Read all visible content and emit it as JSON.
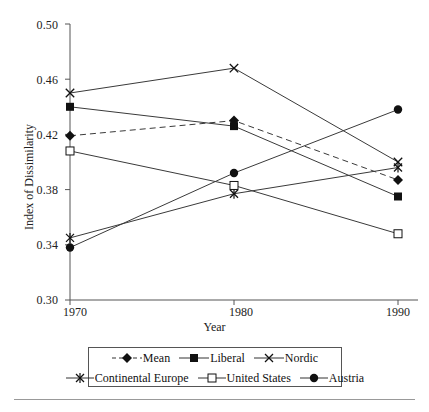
{
  "chart_data": {
    "type": "line",
    "title": "",
    "xlabel": "Year",
    "ylabel": "Index of Dissimilarity",
    "x": [
      1970,
      1980,
      1990
    ],
    "xtick_labels": [
      "1970",
      "1980",
      "1990"
    ],
    "ytick_labels": [
      "0.30",
      "0.34",
      "0.38",
      "0.42",
      "0.46",
      "0.50"
    ],
    "yticks": [
      0.3,
      0.34,
      0.38,
      0.42,
      0.46,
      0.5
    ],
    "ylim": [
      0.3,
      0.5
    ],
    "xlim": [
      1970,
      1990
    ],
    "grid": false,
    "legend_position": "below-bottom-center",
    "series": [
      {
        "name": "Mean",
        "marker": "filled-diamond",
        "linestyle": "dashed",
        "values": [
          0.419,
          0.43,
          0.387
        ]
      },
      {
        "name": "Liberal",
        "marker": "filled-square",
        "linestyle": "solid",
        "values": [
          0.44,
          0.426,
          0.375
        ]
      },
      {
        "name": "Nordic",
        "marker": "cross-x",
        "linestyle": "solid",
        "values": [
          0.45,
          0.468,
          0.4
        ]
      },
      {
        "name": "Continental Europe",
        "marker": "asterisk",
        "linestyle": "solid",
        "values": [
          0.345,
          0.377,
          0.396
        ]
      },
      {
        "name": "United States",
        "marker": "open-square",
        "linestyle": "solid",
        "values": [
          0.408,
          0.383,
          0.348
        ]
      },
      {
        "name": "Austria",
        "marker": "filled-circle",
        "linestyle": "solid",
        "values": [
          0.338,
          0.392,
          0.438
        ]
      }
    ],
    "colors": {
      "line": "#3a3a3a",
      "marker": "#111111",
      "axis": "#555555",
      "text": "#1a1a1a",
      "background": "#ffffff"
    }
  }
}
